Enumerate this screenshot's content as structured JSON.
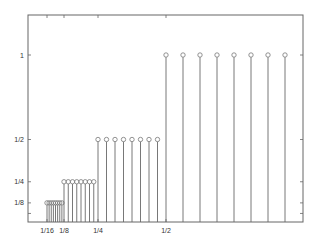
{
  "chart_data": {
    "type": "stem",
    "title": "",
    "xlabel": "",
    "ylabel": "",
    "xlim": [
      0,
      1
    ],
    "ylim": [
      0,
      1.24
    ],
    "grid": false,
    "legend": null,
    "x_ticks": [
      {
        "value": 0.0625,
        "label": "1/16"
      },
      {
        "value": 0.125,
        "label": "1/8"
      },
      {
        "value": 0.25,
        "label": "1/4"
      },
      {
        "value": 0.5,
        "label": "1/2"
      }
    ],
    "y_ticks": [
      {
        "value": 0.0625,
        "label": ""
      },
      {
        "value": 0.125,
        "label": "1/8"
      },
      {
        "value": 0.25,
        "label": "1/4"
      },
      {
        "value": 0.5,
        "label": "1/2"
      },
      {
        "value": 1,
        "label": "1"
      }
    ],
    "series": [
      {
        "name": "level-1/8",
        "x": [
          0.0625,
          0.0703125,
          0.078125,
          0.0859375,
          0.09375,
          0.1015625,
          0.109375,
          0.1171875
        ],
        "y": [
          0.125,
          0.125,
          0.125,
          0.125,
          0.125,
          0.125,
          0.125,
          0.125
        ]
      },
      {
        "name": "level-1/4",
        "x": [
          0.125,
          0.140625,
          0.15625,
          0.171875,
          0.1875,
          0.203125,
          0.21875,
          0.234375
        ],
        "y": [
          0.25,
          0.25,
          0.25,
          0.25,
          0.25,
          0.25,
          0.25,
          0.25
        ]
      },
      {
        "name": "level-1/2",
        "x": [
          0.25,
          0.28125,
          0.3125,
          0.34375,
          0.375,
          0.40625,
          0.4375,
          0.46875
        ],
        "y": [
          0.5,
          0.5,
          0.5,
          0.5,
          0.5,
          0.5,
          0.5,
          0.5
        ]
      },
      {
        "name": "level-1",
        "x": [
          0.5,
          0.5625,
          0.625,
          0.6875,
          0.75,
          0.8125,
          0.875,
          0.9375
        ],
        "y": [
          1,
          1,
          1,
          1,
          1,
          1,
          1,
          1
        ]
      }
    ],
    "colors": {
      "axes": "#666666",
      "stem": "#555555",
      "marker": "#777777",
      "text": "#333333"
    }
  }
}
